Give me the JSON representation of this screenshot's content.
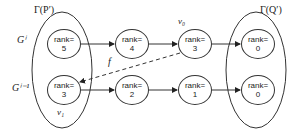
{
  "sets": {
    "left": "Γ(P′)",
    "right": "Γ(Q′)"
  },
  "rows": {
    "top": "Gⁱ",
    "bottom": "Gⁱ⁻¹"
  },
  "labels": {
    "v0": "v₀",
    "v1": "v₁",
    "f": "f"
  },
  "nodes": {
    "top": [
      {
        "label": "rank=",
        "value": "5"
      },
      {
        "label": "rank=",
        "value": "4"
      },
      {
        "label": "rank=",
        "value": "3"
      },
      {
        "label": "rank=",
        "value": "0"
      }
    ],
    "bottom": [
      {
        "label": "rank=",
        "value": "3"
      },
      {
        "label": "rank=",
        "value": "2"
      },
      {
        "label": "rank=",
        "value": "1"
      },
      {
        "label": "rank=",
        "value": "0"
      }
    ]
  }
}
